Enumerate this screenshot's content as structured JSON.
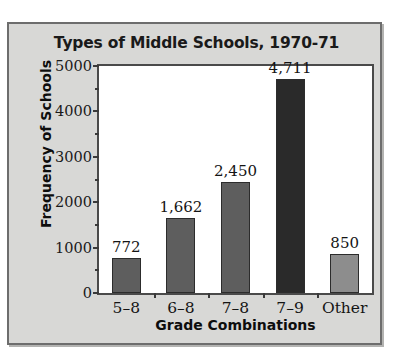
{
  "chart_data": {
    "type": "bar",
    "title": "Types of Middle Schools, 1970-71",
    "xlabel": "Grade Combinations",
    "ylabel": "Frequency of Schools",
    "categories": [
      "5–8",
      "6–8",
      "7–8",
      "7–9",
      "Other"
    ],
    "values": [
      772,
      1662,
      2450,
      4711,
      850
    ],
    "value_labels": [
      "772",
      "1,662",
      "2,450",
      "4,711",
      "850"
    ],
    "bar_colors": [
      "#5e5e5e",
      "#5e5e5e",
      "#5e5e5e",
      "#2a2a2a",
      "#8d8d8d"
    ],
    "ylim": [
      0,
      5000
    ],
    "yticks": [
      0,
      1000,
      2000,
      3000,
      4000,
      5000
    ],
    "ytick_labels": [
      "0",
      "1000",
      "2000",
      "3000",
      "4000",
      "5000"
    ],
    "yticks_minor": [
      500,
      1500,
      2500,
      3500,
      4500
    ],
    "grid": false,
    "legend": false
  },
  "style": {
    "panel_background": "#d8d8d6",
    "plot_background": "#ffffff",
    "frame_color": "#4a4a4a",
    "text_color": "#141414"
  }
}
